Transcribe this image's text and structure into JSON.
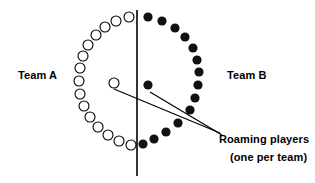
{
  "figure": {
    "background_color": "#ffffff",
    "stroke_color": "#000000",
    "open_marker_fill": "#ffffff",
    "filled_marker_fill": "#111111"
  },
  "labels": {
    "team_a": "Team A",
    "team_b": "Team B",
    "roaming_line1": "Roaming players",
    "roaming_line2": "(one per team)"
  },
  "divider": {
    "name": "vertical-divider-line",
    "x": 137,
    "y1": 10,
    "y2": 176
  },
  "leader_lines": [
    {
      "name": "leader-line-to-team-a-roamer",
      "x1": 220,
      "y1": 133,
      "x2": 114,
      "y2": 89
    },
    {
      "name": "leader-line-to-team-b-roamer",
      "x1": 222,
      "y1": 135,
      "x2": 150,
      "y2": 92
    }
  ],
  "markers": {
    "open_radius": 5,
    "filled_radius": 4.6,
    "team_a_arc": [
      {
        "x": 129,
        "y": 17
      },
      {
        "x": 116,
        "y": 21
      },
      {
        "x": 105,
        "y": 27
      },
      {
        "x": 96,
        "y": 35
      },
      {
        "x": 88,
        "y": 45
      },
      {
        "x": 83,
        "y": 56
      },
      {
        "x": 80,
        "y": 68
      },
      {
        "x": 79,
        "y": 81
      },
      {
        "x": 80,
        "y": 94
      },
      {
        "x": 84,
        "y": 106
      },
      {
        "x": 90,
        "y": 117
      },
      {
        "x": 98,
        "y": 127
      },
      {
        "x": 108,
        "y": 135
      },
      {
        "x": 119,
        "y": 141
      },
      {
        "x": 131,
        "y": 145
      }
    ],
    "team_b_arc": [
      {
        "x": 148,
        "y": 17
      },
      {
        "x": 162,
        "y": 21
      },
      {
        "x": 175,
        "y": 28
      },
      {
        "x": 185,
        "y": 37
      },
      {
        "x": 193,
        "y": 48
      },
      {
        "x": 197,
        "y": 60
      },
      {
        "x": 199,
        "y": 72
      },
      {
        "x": 198,
        "y": 85
      },
      {
        "x": 195,
        "y": 98
      },
      {
        "x": 190,
        "y": 110
      },
      {
        "x": 178,
        "y": 123
      },
      {
        "x": 166,
        "y": 132
      },
      {
        "x": 154,
        "y": 139
      },
      {
        "x": 143,
        "y": 144
      }
    ],
    "roaming_team_a": {
      "x": 114,
      "y": 83,
      "type": "open"
    },
    "roaming_team_b": {
      "x": 148,
      "y": 85,
      "type": "filled"
    }
  }
}
